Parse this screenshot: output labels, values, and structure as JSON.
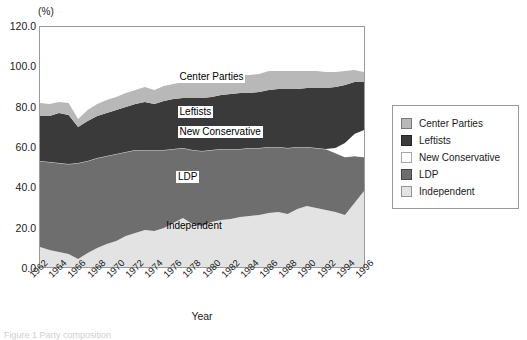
{
  "chart_data": {
    "type": "area",
    "title": "",
    "subtitle": "",
    "xlabel": "Year",
    "ylabel": "",
    "yunit": "(%)",
    "ylim": [
      0,
      120
    ],
    "yticks": [
      "0.0",
      "20.0",
      "40.0",
      "60.0",
      "80.0",
      "100.0",
      "120.0"
    ],
    "ytick_values": [
      0,
      20,
      40,
      60,
      80,
      100,
      120
    ],
    "grid": false,
    "stacked": true,
    "legend_position": "right",
    "categories": [
      1962,
      1963,
      1964,
      1965,
      1966,
      1967,
      1968,
      1969,
      1970,
      1971,
      1972,
      1973,
      1974,
      1975,
      1976,
      1977,
      1978,
      1979,
      1980,
      1981,
      1982,
      1983,
      1984,
      1985,
      1986,
      1987,
      1988,
      1989,
      1990,
      1991,
      1992,
      1993,
      1994,
      1995,
      1996
    ],
    "xtick_labels": [
      "1962",
      "1964",
      "1966",
      "1968",
      "1970",
      "1972",
      "1974",
      "1976",
      "1978",
      "1980",
      "1982",
      "1984",
      "1986",
      "1988",
      "1990",
      "1992",
      "1994",
      "1996"
    ],
    "series": [
      {
        "name": "Independent",
        "color": "#e3e3e3",
        "values": [
          10.0,
          8.5,
          7.5,
          6.5,
          4.0,
          7.0,
          9.5,
          11.5,
          13.0,
          15.5,
          17.0,
          18.5,
          18.0,
          19.5,
          22.0,
          24.5,
          21.5,
          20.5,
          22.5,
          23.5,
          24.0,
          25.0,
          25.5,
          26.0,
          27.0,
          27.5,
          26.5,
          29.0,
          30.5,
          29.5,
          28.5,
          27.5,
          26.0,
          32.0,
          38.0
        ]
      },
      {
        "name": "LDP",
        "color": "#6e6e6e",
        "values": [
          43.0,
          44.0,
          44.5,
          45.0,
          48.0,
          46.0,
          45.0,
          44.0,
          43.5,
          42.0,
          41.5,
          40.0,
          40.5,
          39.0,
          37.0,
          35.0,
          37.0,
          37.5,
          36.0,
          35.5,
          35.0,
          34.0,
          34.0,
          33.5,
          33.0,
          32.5,
          33.0,
          31.0,
          29.5,
          30.0,
          30.5,
          29.5,
          29.0,
          23.5,
          17.0
        ]
      },
      {
        "name": "New Conservative",
        "color": "#ffffff",
        "values": [
          0,
          0,
          0,
          0,
          0,
          0,
          0,
          0,
          0,
          0,
          0,
          0,
          0,
          0,
          0,
          0,
          0,
          0,
          0,
          0,
          0,
          0,
          0,
          0,
          0,
          0,
          0,
          0,
          0,
          0,
          0,
          2.5,
          7.0,
          11.0,
          13.5
        ]
      },
      {
        "name": "Leftists",
        "color": "#3a3a3a",
        "values": [
          22.5,
          23.0,
          25.0,
          24.5,
          18.0,
          20.0,
          21.0,
          21.5,
          22.0,
          22.5,
          23.0,
          24.0,
          23.0,
          24.5,
          25.0,
          25.0,
          26.0,
          26.5,
          26.5,
          27.0,
          27.5,
          28.0,
          27.5,
          28.0,
          28.5,
          29.0,
          29.5,
          29.0,
          29.5,
          30.0,
          30.5,
          30.5,
          29.0,
          26.0,
          24.0
        ]
      },
      {
        "name": "Center Parties",
        "color": "#b8b8b8",
        "values": [
          6.5,
          6.0,
          5.5,
          6.0,
          4.0,
          5.5,
          6.0,
          6.5,
          6.5,
          7.0,
          7.0,
          7.5,
          7.0,
          7.5,
          7.5,
          8.0,
          8.0,
          8.5,
          8.5,
          8.5,
          8.5,
          9.0,
          9.0,
          9.0,
          9.5,
          9.0,
          9.0,
          9.0,
          8.5,
          8.5,
          8.0,
          7.5,
          7.0,
          6.0,
          5.0
        ]
      }
    ],
    "inplot_annotations": [
      {
        "text": "Center Parties",
        "x_pct": 42.5,
        "y_pct": 18.5,
        "boxed": true
      },
      {
        "text": "Leftists",
        "x_pct": 42.5,
        "y_pct": 33.0,
        "boxed": true
      },
      {
        "text": "New Conservative",
        "x_pct": 42.5,
        "y_pct": 41.5,
        "boxed": true
      },
      {
        "text": "LDP",
        "x_pct": 42.0,
        "y_pct": 60.0,
        "boxed": true
      },
      {
        "text": "Independent",
        "x_pct": 39.0,
        "y_pct": 80.0,
        "boxed": false
      }
    ]
  },
  "legend": {
    "items": [
      {
        "label": "Center Parties",
        "color": "#b8b8b8"
      },
      {
        "label": "Leftists",
        "color": "#3a3a3a"
      },
      {
        "label": "New Conservative",
        "color": "#ffffff"
      },
      {
        "label": "LDP",
        "color": "#6e6e6e"
      },
      {
        "label": "Independent",
        "color": "#e3e3e3"
      }
    ]
  },
  "caption": {
    "text": "Figure 1  Party composition"
  }
}
